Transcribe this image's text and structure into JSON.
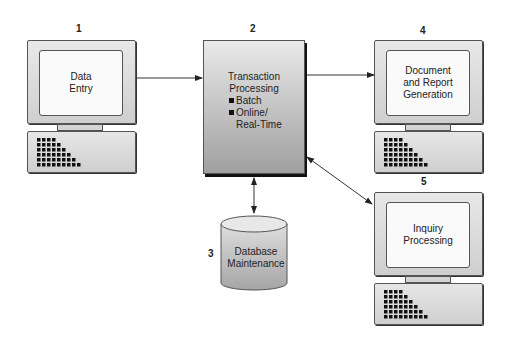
{
  "diagram": {
    "nodes": [
      {
        "id": "1",
        "number": "1",
        "type": "computer",
        "label_lines": [
          "Data",
          "Entry"
        ]
      },
      {
        "id": "2",
        "number": "2",
        "type": "process-box",
        "title_lines": [
          "Transaction",
          "Processing"
        ],
        "bullets": [
          {
            "line1": "Batch"
          },
          {
            "line1": "Online/",
            "line2": "Real-Time"
          }
        ]
      },
      {
        "id": "3",
        "number": "3",
        "type": "database",
        "label_lines": [
          "Database",
          "Maintenance"
        ]
      },
      {
        "id": "4",
        "number": "4",
        "type": "computer",
        "label_lines": [
          "Document",
          "and Report",
          "Generation"
        ]
      },
      {
        "id": "5",
        "number": "5",
        "type": "computer",
        "label_lines": [
          "Inquiry",
          "Processing"
        ]
      }
    ],
    "edges": [
      {
        "from": "1",
        "to": "2",
        "direction": "forward"
      },
      {
        "from": "2",
        "to": "4",
        "direction": "forward"
      },
      {
        "from": "2",
        "to": "3",
        "direction": "both"
      },
      {
        "from": "2",
        "to": "5",
        "direction": "both"
      }
    ],
    "colors": {
      "outline": "#555555",
      "box_top": "#e9e9e9",
      "box_bottom": "#a0a0a0",
      "screen": "#fafafa"
    }
  }
}
